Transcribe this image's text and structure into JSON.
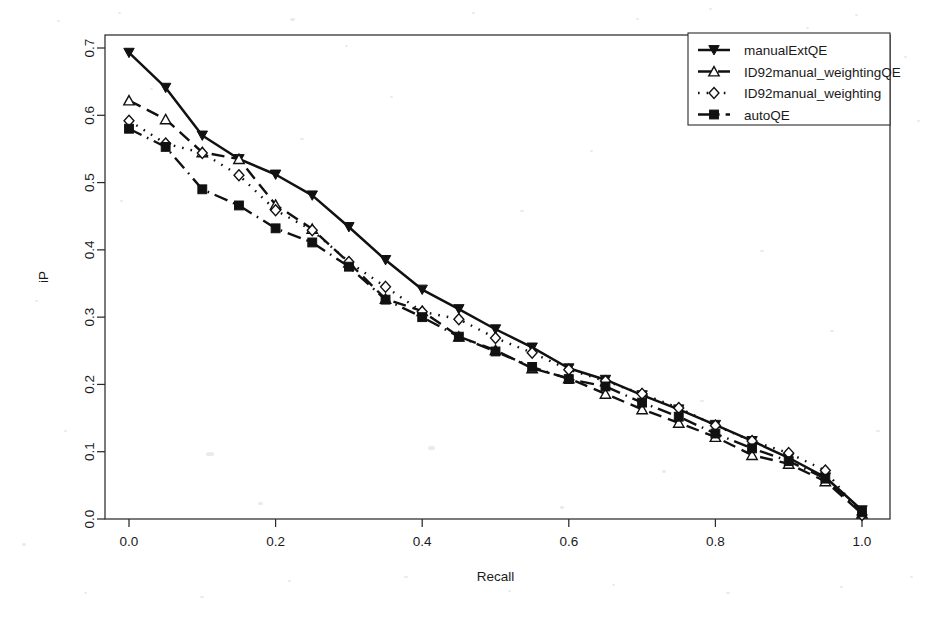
{
  "figure": {
    "background": "#ffffff",
    "ink_color": "#111111",
    "width": 935,
    "height": 617
  },
  "axes": {
    "x_title": "Recall",
    "y_title": "iP",
    "x_ticks": [
      "0.0",
      "0.2",
      "0.4",
      "0.6",
      "0.8",
      "1.0"
    ],
    "x_tick_values": [
      0.0,
      0.2,
      0.4,
      0.6,
      0.8,
      1.0
    ],
    "y_ticks": [
      "0.0",
      "0.1",
      "0.2",
      "0.3",
      "0.4",
      "0.5",
      "0.6",
      "0.7"
    ],
    "y_tick_values": [
      0.0,
      0.1,
      0.2,
      0.3,
      0.4,
      0.5,
      0.6,
      0.7
    ]
  },
  "legend": {
    "position": "top-right",
    "entries": [
      {
        "label": "manualExtQE",
        "marker": "triangle-down-filled",
        "dash": "solid"
      },
      {
        "label": "ID92manual_weightingQE",
        "marker": "triangle-up-open",
        "dash": "dashed"
      },
      {
        "label": "ID92manual_weighting",
        "marker": "diamond-open",
        "dash": "dotted"
      },
      {
        "label": "autoQE",
        "marker": "square-filled",
        "dash": "dashdot"
      }
    ]
  },
  "chart_data": {
    "type": "line",
    "title": "",
    "xlabel": "Recall",
    "ylabel": "iP",
    "xlim": [
      0.0,
      1.0
    ],
    "ylim": [
      0.0,
      0.7
    ],
    "grid": false,
    "legend_position": "top-right",
    "x": [
      0.0,
      0.05,
      0.1,
      0.15,
      0.2,
      0.25,
      0.3,
      0.35,
      0.4,
      0.45,
      0.5,
      0.55,
      0.6,
      0.65,
      0.7,
      0.75,
      0.8,
      0.85,
      0.9,
      0.95,
      1.0
    ],
    "series": [
      {
        "name": "manualExtQE",
        "marker": "triangle-down-filled",
        "dash": "solid",
        "values": [
          0.693,
          0.641,
          0.57,
          0.535,
          0.512,
          0.481,
          0.434,
          0.385,
          0.341,
          0.312,
          0.282,
          0.255,
          0.224,
          0.207,
          0.184,
          0.163,
          0.14,
          0.116,
          0.091,
          0.062,
          0.013
        ]
      },
      {
        "name": "ID92manual_weightingQE",
        "marker": "triangle-up-open",
        "dash": "dashed",
        "values": [
          0.622,
          0.594,
          0.545,
          0.535,
          0.467,
          0.431,
          0.381,
          0.327,
          0.309,
          0.271,
          0.251,
          0.224,
          0.209,
          0.186,
          0.163,
          0.143,
          0.122,
          0.095,
          0.082,
          0.056,
          0.008
        ]
      },
      {
        "name": "ID92manual_weighting",
        "marker": "diamond-open",
        "dash": "dotted",
        "values": [
          0.592,
          0.558,
          0.544,
          0.511,
          0.459,
          0.429,
          0.382,
          0.345,
          0.308,
          0.297,
          0.269,
          0.247,
          0.222,
          0.205,
          0.186,
          0.165,
          0.139,
          0.116,
          0.098,
          0.072,
          0.006
        ]
      },
      {
        "name": "autoQE",
        "marker": "square-filled",
        "dash": "dashdot",
        "values": [
          0.58,
          0.553,
          0.49,
          0.466,
          0.432,
          0.411,
          0.375,
          0.326,
          0.3,
          0.271,
          0.249,
          0.226,
          0.208,
          0.197,
          0.173,
          0.152,
          0.127,
          0.105,
          0.086,
          0.06,
          0.01
        ]
      }
    ]
  }
}
